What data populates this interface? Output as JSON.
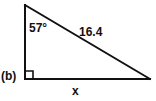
{
  "figure": {
    "part_label": "(b)",
    "shape": "right-triangle",
    "stroke_color": "#111111",
    "background_color": "#ffffff",
    "labels": {
      "angle": "57°",
      "hypotenuse": "16.4",
      "base": "x"
    },
    "geometry": {
      "apex": [
        25,
        5
      ],
      "right_angle_vertex": [
        25,
        79
      ],
      "far_vertex": [
        150,
        79
      ],
      "right_angle_marker_size": 8,
      "stroke_width": 2
    }
  }
}
